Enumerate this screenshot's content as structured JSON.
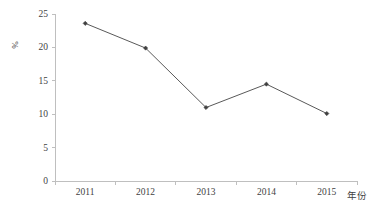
{
  "chart_data": {
    "type": "line",
    "title": "",
    "subtitle": "",
    "xlabel": "年份",
    "ylabel": "%",
    "categories": [
      "2011",
      "2012",
      "2013",
      "2014",
      "2015"
    ],
    "values": [
      23.6,
      19.9,
      11.0,
      14.5,
      10.1
    ],
    "series": [
      {
        "name": "",
        "values": [
          23.6,
          19.9,
          11.0,
          14.5,
          10.1
        ]
      }
    ],
    "ylim": [
      0,
      25
    ],
    "y_ticks": [
      "0",
      "5",
      "10",
      "15",
      "20",
      "25"
    ],
    "y_tick_values": [
      0,
      5,
      10,
      15,
      20,
      25
    ],
    "x_ticks": [
      "2011",
      "2012",
      "2013",
      "2014",
      "2015"
    ],
    "grid": false,
    "legend": false,
    "legend_position": "none",
    "marker": "diamond",
    "line_color": "#595959",
    "marker_color": "#404040",
    "axis_color": "#bfbfbf",
    "text_color": "#3f3f3f",
    "background_color": "#ffffff",
    "annotations": []
  }
}
